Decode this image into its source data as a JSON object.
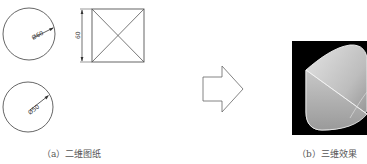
{
  "figure": {
    "panels": [
      {
        "id": "a",
        "caption": "（a）二维图纸",
        "drawings": {
          "top_circle_dimension": "Ø60",
          "bottom_circle_dimension": "Ø50",
          "square_side_dimension": "60"
        }
      },
      {
        "id": "b",
        "caption": "（b）三维效果"
      }
    ],
    "arrow": {
      "direction": "right"
    },
    "colors": {
      "line": "#555555",
      "render_background": "#000000",
      "solid_fill": "#cfcfcf"
    }
  }
}
